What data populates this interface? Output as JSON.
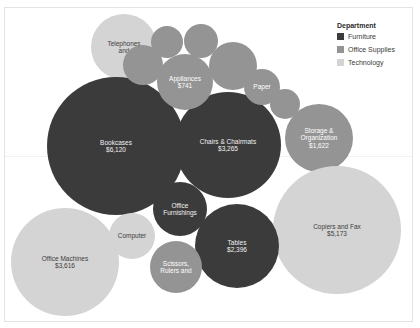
{
  "chart_data": {
    "type": "bubble",
    "title": "",
    "xlabel": "",
    "ylabel": "",
    "grid": false,
    "legend_position": "top-right",
    "legend": {
      "title": "Department",
      "entries": [
        {
          "label": "Furniture",
          "color": "#3b3b3b"
        },
        {
          "label": "Office Supplies",
          "color": "#949494"
        },
        {
          "label": "Technology",
          "color": "#d4d4d4"
        }
      ]
    },
    "series": [
      {
        "name": "Furniture",
        "color": "#3b3b3b",
        "points": [
          {
            "label": "Bookcases",
            "value_text": "$6,120",
            "value": 6120
          },
          {
            "label": "Chairs & Chairmats",
            "value_text": "$3,265",
            "value": 3265
          },
          {
            "label": "Tables",
            "value_text": "$2,396",
            "value": 2396
          },
          {
            "label": "Office Furnishings",
            "value_text": "",
            "value": 1300
          }
        ]
      },
      {
        "name": "Office Supplies",
        "color": "#949494",
        "points": [
          {
            "label": "Storage & Organization",
            "value_text": "$1,622",
            "value": 1622
          },
          {
            "label": "Appliances",
            "value_text": "$741",
            "value": 741
          },
          {
            "label": "Paper",
            "value_text": "",
            "value": 480
          },
          {
            "label": "Scissors, Rulers and",
            "value_text": "",
            "value": 620
          },
          {
            "label": "",
            "value_text": "",
            "value": 430
          },
          {
            "label": "",
            "value_text": "",
            "value": 400
          },
          {
            "label": "",
            "value_text": "",
            "value": 700
          },
          {
            "label": "",
            "value_text": "",
            "value": 350
          },
          {
            "label": "",
            "value_text": "",
            "value": 300
          }
        ]
      },
      {
        "name": "Technology",
        "color": "#d4d4d4",
        "points": [
          {
            "label": "Copiers and Fax",
            "value_text": "$5,173",
            "value": 5173
          },
          {
            "label": "Office Machines",
            "value_text": "$3,616",
            "value": 3616
          },
          {
            "label": "Telephones and",
            "value_text": "",
            "value": 1500
          },
          {
            "label": "Computer",
            "value_text": "",
            "value": 620
          }
        ]
      }
    ],
    "bubbles": [
      {
        "name": "bubble-telephones",
        "label": "Telephones\nand",
        "text": "Telephones\nand",
        "department": "Technology",
        "color": "#d4d4d4",
        "label_style": "lbl-dark",
        "font_size": 6.5,
        "cx": 124,
        "cy": 47,
        "r": 33
      },
      {
        "name": "bubble-bookcases",
        "label": "Bookcases",
        "text": "Bookcases\n$6,120",
        "department": "Furniture",
        "color": "#3b3b3b",
        "label_style": "lbl-light",
        "font_size": 6.5,
        "cx": 116,
        "cy": 146,
        "r": 69
      },
      {
        "name": "bubble-chairs-chairmats",
        "label": "Chairs & Chairmats",
        "text": "Chairs & Chairmats\n$3,265",
        "department": "Furniture",
        "color": "#3b3b3b",
        "label_style": "lbl-light",
        "font_size": 6.5,
        "cx": 228,
        "cy": 145,
        "r": 53
      },
      {
        "name": "bubble-appliances",
        "label": "Appliances",
        "text": "Appliances\n$741",
        "department": "Office Supplies",
        "color": "#949494",
        "label_style": "lbl-mid",
        "font_size": 6.5,
        "cx": 185,
        "cy": 82,
        "r": 28
      },
      {
        "name": "bubble-paper",
        "label": "Paper",
        "text": "Paper",
        "department": "Office Supplies",
        "color": "#949494",
        "label_style": "lbl-mid",
        "font_size": 6.5,
        "cx": 262,
        "cy": 87,
        "r": 18
      },
      {
        "name": "bubble-storage-organization",
        "label": "Storage & Organization",
        "text": "Storage &\nOrganization\n$1,622",
        "department": "Office Supplies",
        "color": "#949494",
        "label_style": "lbl-mid",
        "font_size": 6.5,
        "cx": 319,
        "cy": 138,
        "r": 34
      },
      {
        "name": "bubble-copiers-and-fax",
        "label": "Copiers and Fax",
        "text": "Copiers and Fax\n$5,173",
        "department": "Technology",
        "color": "#d4d4d4",
        "label_style": "lbl-dark",
        "font_size": 6.5,
        "cx": 337,
        "cy": 230,
        "r": 64
      },
      {
        "name": "bubble-office-machines",
        "label": "Office Machines",
        "text": "Office Machines\n$3,616",
        "department": "Technology",
        "color": "#d4d4d4",
        "label_style": "lbl-dark",
        "font_size": 6.5,
        "cx": 65,
        "cy": 262,
        "r": 54
      },
      {
        "name": "bubble-tables",
        "label": "Tables",
        "text": "Tables\n$2,396",
        "department": "Furniture",
        "color": "#3b3b3b",
        "label_style": "lbl-light",
        "font_size": 6.5,
        "cx": 237,
        "cy": 246,
        "r": 42
      },
      {
        "name": "bubble-office-furnishings",
        "label": "Office Furnishings",
        "text": "Office\nFurnishings",
        "department": "Furniture",
        "color": "#3b3b3b",
        "label_style": "lbl-light",
        "font_size": 6.5,
        "cx": 180,
        "cy": 209,
        "r": 27
      },
      {
        "name": "bubble-computer",
        "label": "Computer",
        "text": "Computer",
        "department": "Technology",
        "color": "#d4d4d4",
        "label_style": "lbl-dark",
        "font_size": 6.5,
        "cx": 132,
        "cy": 236,
        "r": 23
      },
      {
        "name": "bubble-scissors-rulers",
        "label": "Scissors, Rulers and",
        "text": "Scissors,\nRulers and",
        "department": "Office Supplies",
        "color": "#949494",
        "label_style": "lbl-mid",
        "font_size": 6.5,
        "cx": 176,
        "cy": 267,
        "r": 26
      },
      {
        "name": "bubble-unlabeled-1",
        "label": "",
        "text": "",
        "department": "Office Supplies",
        "color": "#949494",
        "label_style": "lbl-mid",
        "font_size": 6,
        "cx": 143,
        "cy": 65,
        "r": 20
      },
      {
        "name": "bubble-unlabeled-2",
        "label": "",
        "text": "",
        "department": "Office Supplies",
        "color": "#949494",
        "label_style": "lbl-mid",
        "font_size": 6,
        "cx": 167,
        "cy": 42,
        "r": 16
      },
      {
        "name": "bubble-unlabeled-3",
        "label": "",
        "text": "",
        "department": "Office Supplies",
        "color": "#949494",
        "label_style": "lbl-mid",
        "font_size": 6,
        "cx": 201,
        "cy": 41,
        "r": 17
      },
      {
        "name": "bubble-unlabeled-4",
        "label": "",
        "text": "",
        "department": "Office Supplies",
        "color": "#949494",
        "label_style": "lbl-mid",
        "font_size": 6,
        "cx": 233,
        "cy": 66,
        "r": 24
      },
      {
        "name": "bubble-unlabeled-5",
        "label": "",
        "text": "",
        "department": "Office Supplies",
        "color": "#949494",
        "label_style": "lbl-mid",
        "font_size": 6,
        "cx": 285,
        "cy": 104,
        "r": 15
      }
    ]
  }
}
